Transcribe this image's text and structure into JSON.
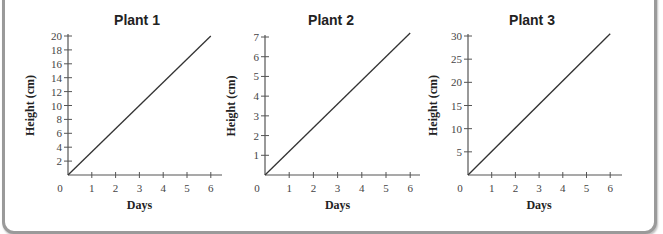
{
  "chart_data": [
    {
      "type": "line",
      "title": "Plant 1",
      "xlabel": "Days",
      "ylabel": "Height (cm)",
      "x": [
        0,
        6
      ],
      "series": [
        {
          "name": "Plant 1",
          "values": [
            0,
            20
          ]
        }
      ],
      "xticks": [
        0,
        1,
        2,
        3,
        4,
        5,
        6
      ],
      "yticks": [
        2,
        4,
        6,
        8,
        10,
        12,
        14,
        16,
        18,
        20
      ],
      "xlim": [
        0,
        6.5
      ],
      "ylim": [
        0,
        20
      ],
      "grid": false,
      "legend": null
    },
    {
      "type": "line",
      "title": "Plant 2",
      "xlabel": "Days",
      "ylabel": "Height (cm)",
      "x": [
        0,
        6
      ],
      "series": [
        {
          "name": "Plant 2",
          "values": [
            0,
            7.2
          ]
        }
      ],
      "xticks": [
        0,
        1,
        2,
        3,
        4,
        5,
        6
      ],
      "yticks": [
        1,
        2,
        3,
        4,
        5,
        6,
        7
      ],
      "xlim": [
        0,
        6.5
      ],
      "ylim": [
        0,
        7
      ],
      "grid": false,
      "legend": null
    },
    {
      "type": "line",
      "title": "Plant 3",
      "xlabel": "Days",
      "ylabel": "Height (cm)",
      "x": [
        0,
        6
      ],
      "series": [
        {
          "name": "Plant 3",
          "values": [
            0,
            30.5
          ]
        }
      ],
      "xticks": [
        0,
        1,
        2,
        3,
        4,
        5,
        6
      ],
      "yticks": [
        5,
        10,
        15,
        20,
        25,
        30
      ],
      "xlim": [
        0,
        6.5
      ],
      "ylim": [
        0,
        30
      ],
      "grid": false,
      "legend": null
    }
  ],
  "charts": [
    {
      "title": "Plant 1",
      "xlabel": "Days",
      "ylabel": "Height (cm)",
      "origin_label": "0"
    },
    {
      "title": "Plant 2",
      "xlabel": "Days",
      "ylabel": "Height (cm)",
      "origin_label": "0"
    },
    {
      "title": "Plant 3",
      "xlabel": "Days",
      "ylabel": "Height (cm)",
      "origin_label": "0"
    }
  ],
  "colors": {
    "line": "#333333",
    "axis": "#555555",
    "frame": "#9a9a9a",
    "text": "#444444"
  }
}
